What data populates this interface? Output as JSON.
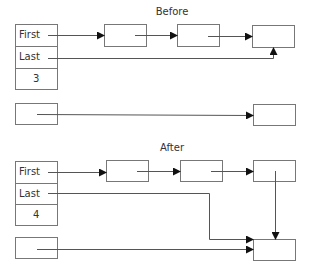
{
  "before": {
    "title": "Before",
    "header": {
      "first_label": "First",
      "last_label": "Last",
      "count": "3"
    },
    "nodes": 3
  },
  "after": {
    "title": "After",
    "header": {
      "first_label": "First",
      "last_label": "Last",
      "count": "4"
    },
    "nodes": 4
  },
  "colors": {
    "line": "#555555",
    "box": "#777777",
    "arrow": "#111111",
    "text": "#333333"
  }
}
